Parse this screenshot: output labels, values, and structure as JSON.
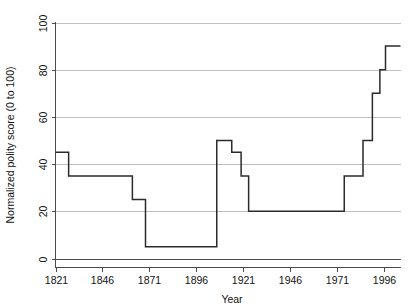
{
  "chart_data": {
    "type": "line",
    "title": "",
    "subtitle": "",
    "xlabel": "Year",
    "ylabel": "Normalized polity score (0 to 100)",
    "xlim": [
      1821,
      2005
    ],
    "ylim": [
      0,
      100
    ],
    "grid": true,
    "legend": false,
    "legend_position": "none",
    "line_style": "step-post",
    "xticks": [
      1821,
      1846,
      1871,
      1896,
      1921,
      1946,
      1971,
      1996
    ],
    "xtick_labels": [
      "1821",
      "1846",
      "1871",
      "1896",
      "1921",
      "1946",
      "1971",
      "1996"
    ],
    "yticks": [
      0,
      20,
      40,
      60,
      80,
      100
    ],
    "ytick_labels": [
      "0",
      "20",
      "40",
      "60",
      "80",
      "100"
    ],
    "series": [
      {
        "name": "Normalized polity score",
        "color": "#2b2b2b",
        "x": [
          1821,
          1828,
          1828,
          1854,
          1854,
          1862,
          1862,
          1869,
          1869,
          1877,
          1877,
          1907,
          1907,
          1915,
          1915,
          1920,
          1920,
          1924,
          1924,
          1975,
          1975,
          1985,
          1985,
          1990,
          1990,
          1994,
          1994,
          1997,
          1997,
          2005
        ],
        "y": [
          45,
          45,
          35,
          35,
          35,
          35,
          25,
          25,
          25,
          5,
          5,
          5,
          50,
          50,
          45,
          45,
          35,
          35,
          20,
          20,
          35,
          35,
          50,
          50,
          70,
          70,
          80,
          80,
          90,
          90
        ],
        "steps": [
          {
            "start_year": 1821,
            "end_year": 1828,
            "value": 45
          },
          {
            "start_year": 1828,
            "end_year": 1862,
            "value": 35
          },
          {
            "start_year": 1862,
            "end_year": 1869,
            "value": 25
          },
          {
            "start_year": 1869,
            "end_year": 1907,
            "value": 5
          },
          {
            "start_year": 1907,
            "end_year": 1915,
            "value": 50
          },
          {
            "start_year": 1915,
            "end_year": 1920,
            "value": 45
          },
          {
            "start_year": 1920,
            "end_year": 1924,
            "value": 35
          },
          {
            "start_year": 1924,
            "end_year": 1975,
            "value": 20
          },
          {
            "start_year": 1975,
            "end_year": 1985,
            "value": 35
          },
          {
            "start_year": 1985,
            "end_year": 1990,
            "value": 50
          },
          {
            "start_year": 1990,
            "end_year": 1994,
            "value": 70
          },
          {
            "start_year": 1994,
            "end_year": 1997,
            "value": 80
          },
          {
            "start_year": 1997,
            "end_year": 2005,
            "value": 90
          }
        ]
      }
    ]
  }
}
